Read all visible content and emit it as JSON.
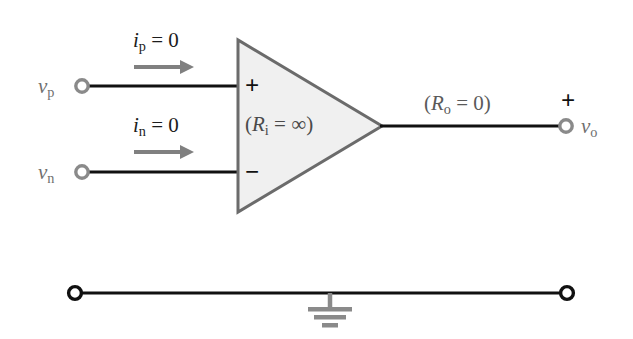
{
  "figure": {
    "type": "circuit-diagram",
    "background_color": "#ffffff"
  },
  "colors": {
    "wire": "#111111",
    "amp_outline": "#6b6b6b",
    "amp_fill": "#f0f0f0",
    "input_terminal": "#8a8a8a",
    "ground_terminal": "#111111",
    "arrow": "#808080",
    "label_gray": "#6f6f6f",
    "label_dark": "#1c1c1c",
    "ground_symbol": "#8a8a8a"
  },
  "labels": {
    "v_p": {
      "base": "v",
      "sub": "p"
    },
    "v_n": {
      "base": "v",
      "sub": "n"
    },
    "v_o": {
      "base": "v",
      "sub": "o"
    },
    "i_p": {
      "base": "i",
      "sub": "p",
      "eq": " = 0"
    },
    "i_n": {
      "base": "i",
      "sub": "n",
      "eq": " = 0"
    },
    "r_in": {
      "open": "(",
      "base": "R",
      "sub": "i",
      "eq": " = ",
      "value": "∞",
      "close": ")"
    },
    "r_out": {
      "open": "(",
      "base": "R",
      "sub": "o",
      "eq": " = ",
      "value": "0",
      "close": ")"
    },
    "plus_input": "+",
    "minus_input": "−",
    "plus_output": "+"
  },
  "geometry": {
    "amplifier": {
      "left_x": 238,
      "top_y": 40,
      "bottom_y": 212,
      "apex_x": 382,
      "apex_y": 126
    },
    "noninverting_input": {
      "terminal_x": 82,
      "y": 86
    },
    "inverting_input": {
      "terminal_x": 82,
      "y": 172
    },
    "output": {
      "terminal_x": 566,
      "y": 126
    },
    "ground_rail": {
      "y": 293,
      "left_x": 75,
      "right_x": 567,
      "ground_x": 330
    }
  }
}
